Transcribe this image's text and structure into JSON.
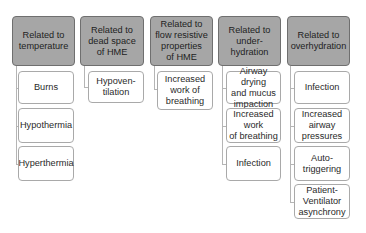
{
  "diagram": {
    "colors": {
      "header_fill": "#a6a6a6",
      "header_border": "#6f6f6f",
      "child_fill": "#ffffff",
      "child_border": "#a9a9a9",
      "connector": "#b5b5b5"
    },
    "columns": [
      {
        "header": "Related to\ntemperature",
        "children": [
          "Burns",
          "Hypothermia",
          "Hyperthermia"
        ]
      },
      {
        "header": "Related to\ndead space\nof HME",
        "children": [
          "Hypoven-\ntilation"
        ]
      },
      {
        "header": "Related to\nflow resistive\nproperties\nof HME",
        "children": [
          "Increased\nwork of\nbreathing"
        ]
      },
      {
        "header": "Related to\nunder-\nhydration",
        "children": [
          "Airway drying\nand mucus\nimpaction",
          "Increased\nwork\nof breathing",
          "Infection"
        ]
      },
      {
        "header": "Related to\noverhydration",
        "children": [
          "Infection",
          "Increased\nairway\npressures",
          "Auto-\ntriggering",
          "Patient-\nVentilator\nasynchrony"
        ]
      }
    ]
  }
}
